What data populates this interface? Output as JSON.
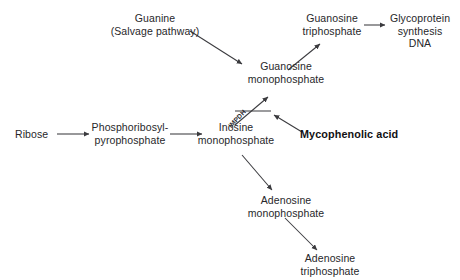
{
  "diagram": {
    "stroke_color": "#3a3a3e",
    "text_color": "#27272a",
    "background": "#ffffff",
    "nodes": [
      {
        "id": "guanine",
        "label": "Guanine\n(Salvage pathway)"
      },
      {
        "id": "ribose",
        "label": "Ribose"
      },
      {
        "id": "prpp",
        "label": "Phosphoribosyl-\npyrophosphate"
      },
      {
        "id": "imp",
        "label": "Inosine\nmonophosphate"
      },
      {
        "id": "gmp",
        "label": "Guanosine\nmonophosphate"
      },
      {
        "id": "gtp",
        "label": "Guanosine\ntriphosphate"
      },
      {
        "id": "glycoprotein",
        "label": "Glycoprotein\nsynthesis\nDNA"
      },
      {
        "id": "amp",
        "label": "Adenosine\nmonophosphate"
      },
      {
        "id": "atp",
        "label": "Adenosine\ntriphosphate"
      },
      {
        "id": "mycophenolic",
        "label": "Mycophenolic acid"
      }
    ],
    "enzymes": [
      {
        "id": "impdh",
        "label": "IMPDH"
      }
    ],
    "edges": [
      {
        "from": "guanine",
        "to": "gmp",
        "kind": "arrow"
      },
      {
        "from": "ribose",
        "to": "prpp",
        "kind": "arrow"
      },
      {
        "from": "prpp",
        "to": "imp",
        "kind": "arrow"
      },
      {
        "from": "imp",
        "to": "gmp",
        "kind": "arrow",
        "enzyme": "impdh",
        "blocked": true
      },
      {
        "from": "gmp",
        "to": "gtp",
        "kind": "arrow"
      },
      {
        "from": "gtp",
        "to": "glycoprotein",
        "kind": "arrow"
      },
      {
        "from": "imp",
        "to": "amp",
        "kind": "arrow"
      },
      {
        "from": "amp",
        "to": "atp",
        "kind": "arrow"
      },
      {
        "from": "mycophenolic",
        "to": "impdh",
        "kind": "inhibition-arrow"
      }
    ]
  }
}
